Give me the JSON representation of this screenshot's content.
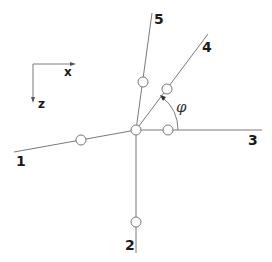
{
  "diagram": {
    "axes": {
      "x_label": "x",
      "z_label": "z"
    },
    "branches": [
      {
        "id": "1",
        "label": "1"
      },
      {
        "id": "2",
        "label": "2"
      },
      {
        "id": "3",
        "label": "3"
      },
      {
        "id": "4",
        "label": "4"
      },
      {
        "id": "5",
        "label": "5"
      }
    ],
    "angle_label": "φ",
    "colors": {
      "line": "#7a7a7a",
      "text": "#1a1a1a",
      "background": "#ffffff"
    }
  }
}
